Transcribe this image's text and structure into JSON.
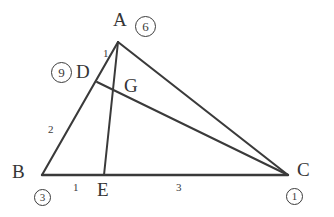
{
  "diagram": {
    "type": "geometry-triangle",
    "stroke_color": "#3a3a3a",
    "background": "#ffffff",
    "vertex_labels": [
      {
        "name": "A",
        "text": "A",
        "x": 113,
        "y": 10
      },
      {
        "name": "B",
        "text": "B",
        "x": 12,
        "y": 162
      },
      {
        "name": "C",
        "text": "C",
        "x": 297,
        "y": 160
      },
      {
        "name": "D",
        "text": "D",
        "x": 76,
        "y": 62
      },
      {
        "name": "E",
        "text": "E",
        "x": 97,
        "y": 180
      },
      {
        "name": "G",
        "text": "G",
        "x": 124,
        "y": 76
      }
    ],
    "segment_labels": [
      {
        "name": "ad-length",
        "text": "1",
        "x": 103,
        "y": 48
      },
      {
        "name": "bd-length",
        "text": "2",
        "x": 48,
        "y": 124
      },
      {
        "name": "be-length",
        "text": "1",
        "x": 73,
        "y": 182
      },
      {
        "name": "ec-length",
        "text": "3",
        "x": 176,
        "y": 182
      }
    ],
    "circled_numbers": [
      {
        "name": "circled-six",
        "text": "6",
        "x": 135,
        "y": 16,
        "size": "big"
      },
      {
        "name": "circled-nine",
        "text": "9",
        "x": 51,
        "y": 62,
        "size": "big"
      },
      {
        "name": "circled-three",
        "text": "3",
        "x": 34,
        "y": 189,
        "size": "small"
      },
      {
        "name": "circled-one",
        "text": "1",
        "x": 286,
        "y": 188,
        "size": "small"
      }
    ],
    "points": {
      "A": {
        "x": 118,
        "y": 42
      },
      "B": {
        "x": 42,
        "y": 175
      },
      "C": {
        "x": 288,
        "y": 175
      },
      "D": {
        "x": 97,
        "y": 82
      },
      "E": {
        "x": 104,
        "y": 175
      },
      "G": {
        "x": 120,
        "y": 90
      }
    },
    "edges": [
      {
        "name": "edge-ab",
        "from": "A",
        "to": "B"
      },
      {
        "name": "edge-ac",
        "from": "A",
        "to": "C"
      },
      {
        "name": "edge-bc",
        "from": "B",
        "to": "C"
      },
      {
        "name": "edge-ae",
        "from": "A",
        "to": "E"
      },
      {
        "name": "edge-dc",
        "from": "D",
        "to": "C"
      }
    ]
  }
}
